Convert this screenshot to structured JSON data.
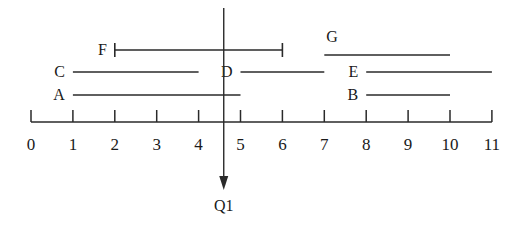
{
  "figure": {
    "title": "",
    "query_marker": {
      "label": "Q1",
      "value": 4.6
    }
  },
  "chart_data": {
    "type": "bar",
    "title": "",
    "xlabel": "",
    "ylabel": "",
    "xlim": [
      0,
      11
    ],
    "grid": false,
    "legend": "none",
    "axis_ticks": [
      "0",
      "1",
      "2",
      "3",
      "4",
      "5",
      "6",
      "7",
      "8",
      "9",
      "10",
      "11"
    ],
    "axis_tick_values": [
      0,
      1,
      2,
      3,
      4,
      5,
      6,
      7,
      8,
      9,
      10,
      11
    ],
    "marker": {
      "name": "Q1",
      "x": 4.6
    },
    "intervals": [
      {
        "name": "F",
        "start": 2,
        "end": 6,
        "row": 0,
        "bracketed": true,
        "label_side": "left"
      },
      {
        "name": "G",
        "start": 7,
        "end": 10,
        "row": 0,
        "bracketed": false,
        "label_side": "above"
      },
      {
        "name": "C",
        "start": 1,
        "end": 4,
        "row": 1,
        "bracketed": false,
        "label_side": "left"
      },
      {
        "name": "D",
        "start": 5,
        "end": 7,
        "row": 1,
        "bracketed": false,
        "label_side": "left"
      },
      {
        "name": "E",
        "start": 8,
        "end": 11,
        "row": 1,
        "bracketed": false,
        "label_side": "left"
      },
      {
        "name": "A",
        "start": 1,
        "end": 5,
        "row": 2,
        "bracketed": false,
        "label_side": "left"
      },
      {
        "name": "B",
        "start": 8,
        "end": 10,
        "row": 2,
        "bracketed": false,
        "label_side": "left"
      }
    ]
  }
}
